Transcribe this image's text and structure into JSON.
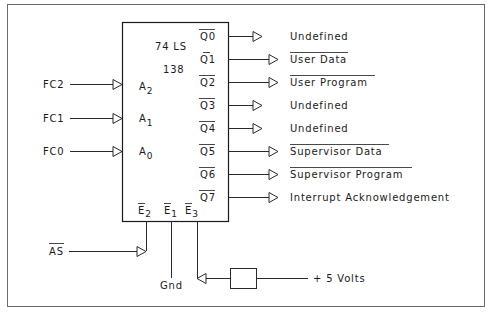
{
  "chip": {
    "family": "74 LS",
    "part": "138"
  },
  "inputs": [
    {
      "signal": "FC2",
      "pin": "A",
      "sub": "2"
    },
    {
      "signal": "FC1",
      "pin": "A",
      "sub": "1"
    },
    {
      "signal": "FC0",
      "pin": "A",
      "sub": "0"
    }
  ],
  "outputs": [
    {
      "pin": "Q0",
      "label": "Undefined",
      "active_low_label": false
    },
    {
      "pin": "Q1",
      "label": "User Data",
      "active_low_label": true
    },
    {
      "pin": "Q2",
      "label": "User Program",
      "active_low_label": true
    },
    {
      "pin": "Q3",
      "label": "Undefined",
      "active_low_label": false
    },
    {
      "pin": "Q4",
      "label": "Undefined",
      "active_low_label": false
    },
    {
      "pin": "Q5",
      "label": "Supervisor Data",
      "active_low_label": true
    },
    {
      "pin": "Q6",
      "label": "Supervisor Program",
      "active_low_label": true
    },
    {
      "pin": "Q7",
      "label": "Interrupt Acknowledgement",
      "active_low_label": false
    }
  ],
  "enables": [
    {
      "pin": "E",
      "sub": "2"
    },
    {
      "pin": "E",
      "sub": "1"
    },
    {
      "pin": "E",
      "sub": "3"
    }
  ],
  "enable_connections": {
    "e2_signal": "AS",
    "e1_signal": "Gnd",
    "e3_signal": "+ 5 Volts"
  }
}
